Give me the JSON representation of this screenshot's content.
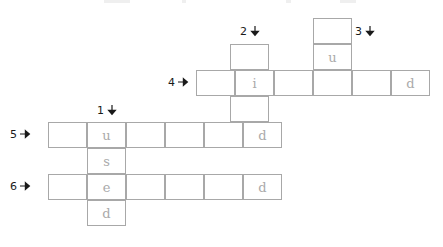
{
  "puzzle": {
    "title": "crossword-grid",
    "cell_width": 39,
    "cell_height": 26,
    "grid_line_color": "#a8a8a8",
    "letter_color": "#b0b0b0",
    "label_color": "#1a1a1a",
    "background": "#ffffff"
  },
  "labels": [
    {
      "id": "label-1",
      "number": "1",
      "direction": "down",
      "arrow_icon": "arrow-down-icon",
      "x": 97,
      "y": 104
    },
    {
      "id": "label-2",
      "number": "2",
      "direction": "down",
      "arrow_icon": "arrow-down-icon",
      "x": 240,
      "y": 25
    },
    {
      "id": "label-3",
      "number": "3",
      "direction": "down",
      "arrow_icon": "arrow-down-icon",
      "x": 355,
      "y": 25
    },
    {
      "id": "label-4",
      "number": "4",
      "direction": "across",
      "arrow_icon": "arrow-right-icon",
      "x": 168,
      "y": 76
    },
    {
      "id": "label-5",
      "number": "5",
      "direction": "across",
      "arrow_icon": "arrow-right-icon",
      "x": 10,
      "y": 128
    },
    {
      "id": "label-6",
      "number": "6",
      "direction": "across",
      "arrow_icon": "arrow-right-icon",
      "x": 10,
      "y": 180
    }
  ],
  "entries": [
    {
      "id": "entry-1-down",
      "number": "1",
      "direction": "down",
      "x": 87,
      "y": 122,
      "letters": [
        "u",
        "s",
        "e",
        "d"
      ]
    },
    {
      "id": "entry-2-down",
      "number": "2",
      "direction": "down",
      "x": 230,
      "y": 44,
      "letters": [
        "",
        "i",
        "",
        "d"
      ]
    },
    {
      "id": "entry-3-down",
      "number": "3",
      "direction": "down",
      "x": 313,
      "y": 18,
      "letters": [
        "",
        "u",
        ""
      ]
    },
    {
      "id": "entry-4-across",
      "number": "4",
      "direction": "across",
      "x": 196,
      "y": 70,
      "letters": [
        "",
        "i",
        "",
        "",
        "",
        "d"
      ]
    },
    {
      "id": "entry-5-across",
      "number": "5",
      "direction": "across",
      "x": 48,
      "y": 122,
      "letters": [
        "",
        "u",
        "",
        "",
        "",
        "d"
      ]
    },
    {
      "id": "entry-6-across",
      "number": "6",
      "direction": "across",
      "x": 48,
      "y": 174,
      "letters": [
        "",
        "e",
        "",
        "",
        "",
        "d"
      ]
    }
  ],
  "top_remnants": [
    {
      "x": 104,
      "width": 26
    },
    {
      "x": 182,
      "width": 4
    },
    {
      "x": 286,
      "width": 5
    },
    {
      "x": 340,
      "width": 16
    }
  ]
}
